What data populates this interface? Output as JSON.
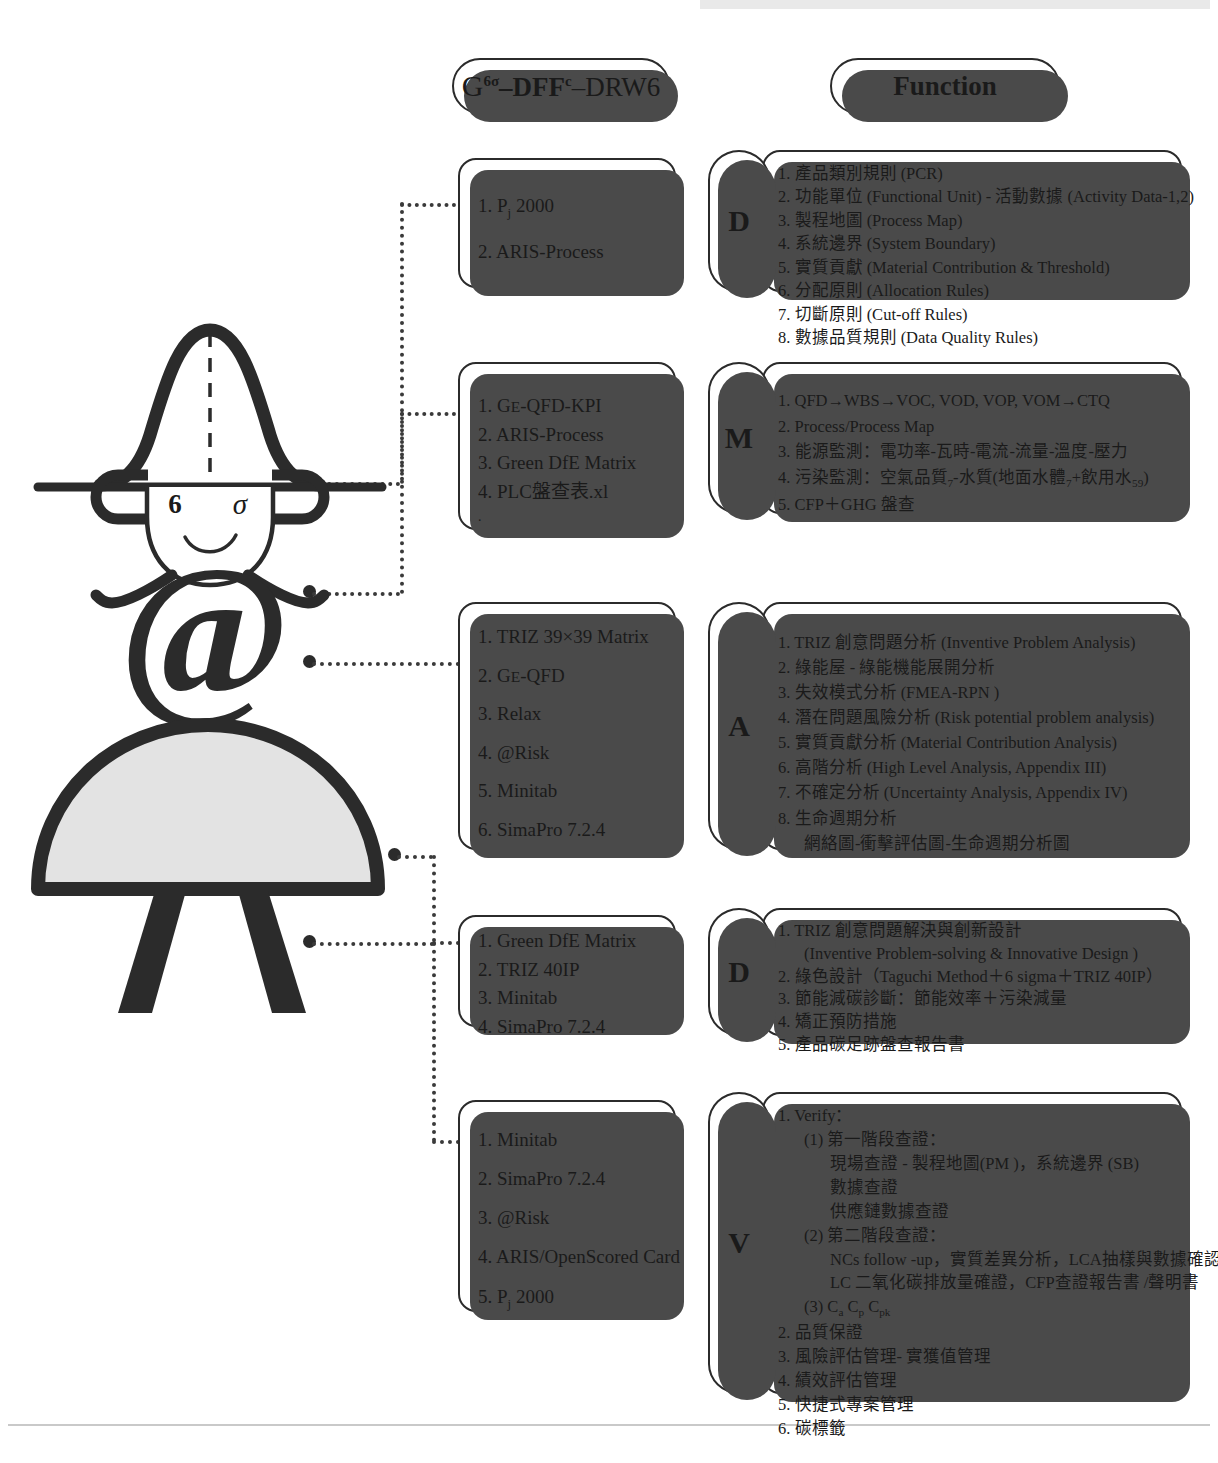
{
  "diagram": {
    "title_tools": "G6σ-DFFc-DRW6",
    "title_function": "Function",
    "title_parts": {
      "g": "G",
      "g_sup": "6σ",
      "dff": "–DFF",
      "dff_sup": "c",
      "drw": "–DRW6"
    }
  },
  "mascot": {
    "label_six": "6",
    "label_sigma": "σ",
    "at_symbol": "@",
    "name": "six-sigma-character"
  },
  "phases": [
    {
      "letter": "D",
      "name": "define",
      "tools": [
        "1. Pj 2000",
        "2. ARIS-Process"
      ],
      "tools_rich": [
        {
          "num": "1.",
          "text": "P",
          "sub": "j",
          "tail": " 2000"
        },
        {
          "num": "2.",
          "text": "ARIS-Process",
          "sub": "",
          "tail": ""
        }
      ],
      "functions": [
        "1. 產品類別規則 (PCR)",
        "2. 功能單位 (Functional Unit) - 活動數據 (Activity Data-1,2)",
        "3. 製程地圖 (Process Map)",
        "4. 系統邊界 (System Boundary)",
        "5. 實質貢獻 (Material Contribution & Threshold)",
        "6. 分配原則 (Allocation Rules)",
        "7. 切斷原則 (Cut-off Rules)",
        "8. 數據品質規則 (Data Quality Rules)"
      ]
    },
    {
      "letter": "M",
      "name": "measure",
      "tools": [
        "1. GE-QFD-KPI",
        "2. ARIS-Process",
        "3. Green DfE Matrix",
        "4. PLC盤查表.xl",
        "."
      ],
      "functions": [
        "1. QFD→WBS→VOC, VOD, VOP, VOM→CTQ",
        "2. Process/Process Map",
        "3. 能源監測：電功率-瓦時-電流-流量-溫度-壓力",
        "4. 污染監測：空氣品質7-水質(地面水體7+飲用水59)",
        "5. CFP＋GHG 盤查"
      ]
    },
    {
      "letter": "A",
      "name": "analyze",
      "tools": [
        "1. TRIZ 39×39 Matrix",
        "2. GE-QFD",
        "3. Relax",
        "4. @Risk",
        "5. Minitab",
        "6. SimaPro 7.2.4"
      ],
      "functions": [
        "1. TRIZ 創意問題分析 (Inventive Problem Analysis)",
        "2. 綠能屋 - 綠能機能展開分析",
        "3. 失效模式分析 (FMEA-RPN )",
        "4. 潛在問題風險分析 (Risk potential problem analysis)",
        "5. 實質貢獻分析 (Material Contribution Analysis)",
        "6. 高階分析  (High Level Analysis, Appendix III)",
        "7. 不確定分析 (Uncertainty Analysis, Appendix IV)",
        "8. 生命週期分析",
        "網絡圖-衝擊評估圖-生命週期分析圖"
      ]
    },
    {
      "letter": "D",
      "name": "design",
      "tools": [
        "1. Green DfE Matrix",
        "2. TRIZ 40IP",
        "3. Minitab",
        "4. SimaPro 7.2.4"
      ],
      "functions": [
        "1. TRIZ 創意問題解決與創新設計",
        "(Inventive Problem-solving & Innovative Design )",
        "2. 綠色設計（Taguchi Method＋6 sigma＋TRIZ 40IP）",
        "3. 節能減碳診斷：節能效率＋污染減量",
        "4. 矯正預防措施",
        "5. 產品碳足跡盤查報告書"
      ]
    },
    {
      "letter": "V",
      "name": "verify",
      "tools": [
        "1. Minitab",
        "2. SimaPro 7.2.4",
        "3. @Risk",
        "4. ARIS/OpenScored Card",
        "5. Pj 2000"
      ],
      "functions": [
        "1. Verify：",
        "(1) 第一階段查證：",
        "現場查證 - 製程地圖(PM )，系統邊界 (SB)",
        "數據查證",
        "供應鏈數據查證",
        "(2) 第二階段查證：",
        "NCs follow -up，實質差異分析，LCA抽樣與數據確認，",
        "LC 二氧化碳排放量確證，CFP查證報告書 /聲明書",
        "(3) Ca Cp Cpk",
        "2. 品質保證",
        "3. 風險評估管理- 實獲值管理",
        "4. 績效評估管理",
        "5. 快捷式專案管理",
        "6. 碳標籤"
      ]
    }
  ],
  "colors": {
    "ink": "#1a1a1a",
    "stroke": "#2b2b2b",
    "shadow": "#4a4a4a",
    "skirt_fill": "#e3e3e3",
    "paper": "#ffffff"
  }
}
